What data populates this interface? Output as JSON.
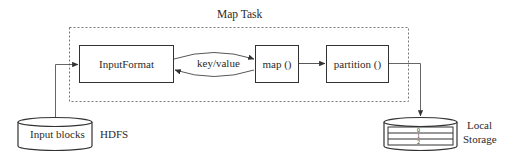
{
  "diagram": {
    "container": {
      "label": "Map Task"
    },
    "nodes": {
      "input_format": "InputFormat",
      "map": "map ()",
      "partition": "partition ()",
      "input_blocks": "Input blocks",
      "local_storage_label_line1": "Local",
      "local_storage_label_line2": "Storage",
      "hdfs": "HDFS"
    },
    "edges": {
      "key_value": "key/value"
    },
    "partitions": [
      "0",
      "1",
      "2"
    ]
  }
}
